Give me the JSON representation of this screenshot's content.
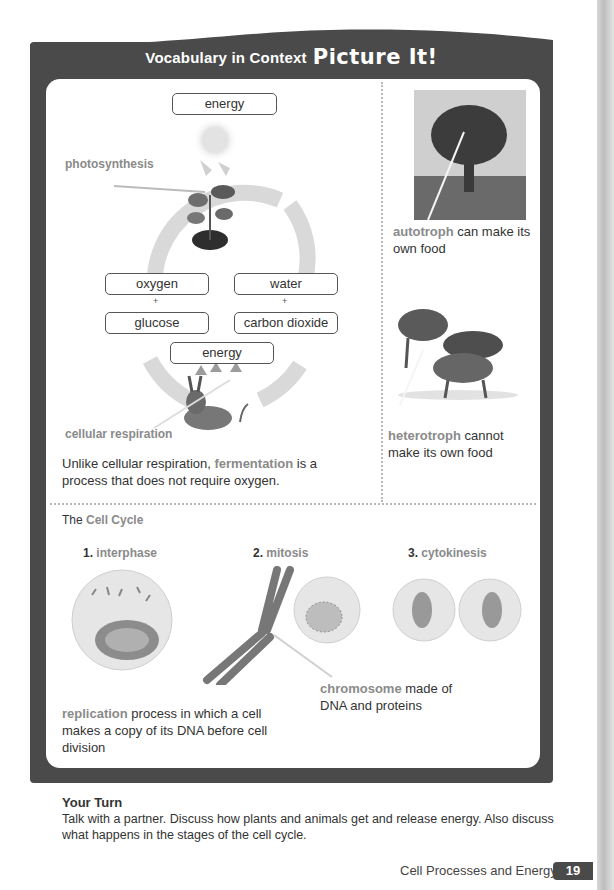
{
  "header": {
    "title_small": "Vocabulary in Context",
    "title_big": "Picture It!"
  },
  "energy_diagram": {
    "top_box": "energy",
    "photosynthesis_label": "photosynthesis",
    "left_top_box": "oxygen",
    "left_bottom_box": "glucose",
    "right_top_box": "water",
    "right_bottom_box": "carbon dioxide",
    "plus": "+",
    "bottom_box": "energy",
    "cellular_respiration_label": "cellular respiration",
    "note_prefix": "Unlike cellular respiration, ",
    "note_term": "fermentation",
    "note_suffix": " is a process that does not require oxygen."
  },
  "autotroph": {
    "term": "autotroph",
    "definition": " can make its own food"
  },
  "heterotroph": {
    "term": "heterotroph",
    "definition": " cannot make its own food"
  },
  "cell_cycle": {
    "title_prefix": "The ",
    "title_term": "Cell Cycle",
    "stages": [
      {
        "num": "1.",
        "name": "interphase"
      },
      {
        "num": "2.",
        "name": "mitosis"
      },
      {
        "num": "3.",
        "name": "cytokinesis"
      }
    ],
    "chromosome_term": "chromosome",
    "chromosome_def": " made of DNA and proteins",
    "replication_term": "replication",
    "replication_def": " process in which a cell makes a copy of its DNA before cell division"
  },
  "your_turn": {
    "heading": "Your Turn",
    "body": "Talk with a partner. Discuss how plants and animals get and release energy. Also discuss what happens in the stages of the cell cycle."
  },
  "footer": {
    "chapter_title": "Cell Processes and Energy",
    "page_number": "19"
  }
}
